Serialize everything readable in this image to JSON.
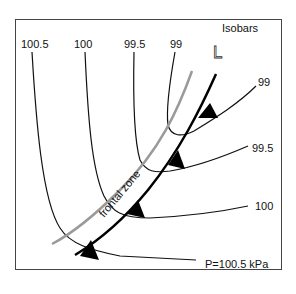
{
  "diagram": {
    "legend_title": "Isobars",
    "low_symbol": "L",
    "frontal_zone_label": "frontal zone",
    "isobar_labels_top": [
      "100.5",
      "100",
      "99.5",
      "99"
    ],
    "isobar_labels_right": [
      "99",
      "99.5",
      "100",
      "P=100.5 kPa"
    ],
    "colors": {
      "isobar": "#111111",
      "front": "#000000",
      "frontal_zone_edge": "#9a9a9a",
      "frame": "#333333"
    }
  }
}
